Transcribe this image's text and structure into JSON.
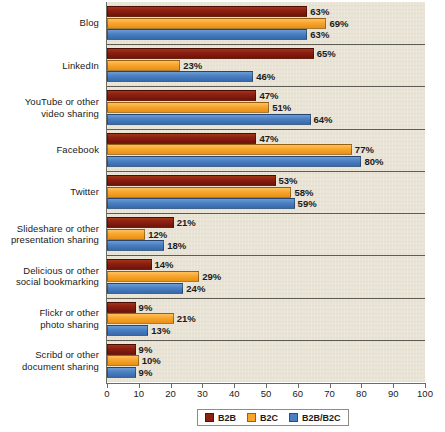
{
  "chart_data": {
    "type": "bar",
    "orientation": "horizontal",
    "title": "",
    "subtitle": "",
    "xlabel": "",
    "ylabel": "",
    "xlim": [
      0,
      100
    ],
    "xticks": [
      0,
      10,
      20,
      30,
      40,
      50,
      60,
      70,
      80,
      90,
      100
    ],
    "grid": false,
    "legend_position": "bottom",
    "value_suffix": "%",
    "categories": [
      "Blog",
      "LinkedIn",
      "YouTube or other\nvideo sharing",
      "Facebook",
      "Twitter",
      "Slideshare or other\npresentation sharing",
      "Delicious or other\nsocial bookmarking",
      "Flickr or other\nphoto sharing",
      "Scribd or other\ndocument sharing"
    ],
    "category_lines": [
      [
        "Blog"
      ],
      [
        "LinkedIn"
      ],
      [
        "YouTube or other",
        "video sharing"
      ],
      [
        "Facebook"
      ],
      [
        "Twitter"
      ],
      [
        "Slideshare or other",
        "presentation sharing"
      ],
      [
        "Delicious or other",
        "social bookmarking"
      ],
      [
        "Flickr or other",
        "photo sharing"
      ],
      [
        "Scribd or other",
        "document sharing"
      ]
    ],
    "series": [
      {
        "name": "B2B",
        "color": "#8c2011",
        "values": [
          63,
          65,
          47,
          47,
          53,
          21,
          14,
          9,
          9
        ],
        "labels": [
          "63%",
          "65%",
          "47%",
          "47%",
          "53%",
          "21%",
          "14%",
          "9%",
          "9%"
        ]
      },
      {
        "name": "B2C",
        "color": "#f7a52b",
        "values": [
          69,
          23,
          51,
          77,
          58,
          12,
          29,
          21,
          10
        ],
        "labels": [
          "69%",
          "23%",
          "51%",
          "77%",
          "58%",
          "12%",
          "29%",
          "21%",
          "10%"
        ]
      },
      {
        "name": "B2B/B2C",
        "color": "#4a7fc1",
        "values": [
          63,
          46,
          64,
          80,
          59,
          18,
          24,
          13,
          9
        ],
        "labels": [
          "63%",
          "46%",
          "64%",
          "80%",
          "59%",
          "18%",
          "24%",
          "13%",
          "9%"
        ]
      }
    ]
  },
  "legend": {
    "items": [
      {
        "label": "B2B",
        "color": "#8c2011"
      },
      {
        "label": "B2C",
        "color": "#f7a52b"
      },
      {
        "label": "B2B/B2C",
        "color": "#4a7fc1"
      }
    ]
  },
  "axis": {
    "tick_labels": [
      "0",
      "10",
      "20",
      "30",
      "40",
      "50",
      "60",
      "70",
      "80",
      "90",
      "100"
    ]
  },
  "colors": {
    "plot_background": "#e9e3d5",
    "axis_line": "#6b6b63",
    "separator": "#5d5d55",
    "text": "#1a1a1a"
  }
}
